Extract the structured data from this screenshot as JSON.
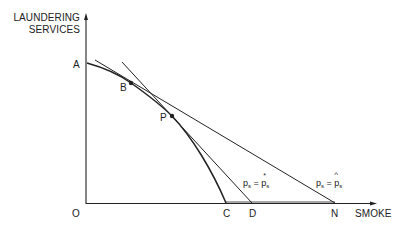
{
  "diagram": {
    "y_axis_label_line1": "LAUNDERING",
    "y_axis_label_line2": "SERVICES",
    "x_axis_label": "SMOKE",
    "origin_label": "O",
    "points": {
      "A": "A",
      "B": "B",
      "P": "P",
      "C": "C",
      "D": "D",
      "N": "N"
    },
    "line_labels": {
      "star_lhs": "p",
      "star_lhs_sub": "s",
      "star_eq": "=",
      "star_rhs": "p",
      "star_rhs_sub": "s",
      "star_mark": "*",
      "hat_lhs": "p",
      "hat_lhs_sub": "s",
      "hat_eq": "=",
      "hat_rhs": "p",
      "hat_rhs_sub": "s",
      "hat_mark": "^"
    },
    "colors": {
      "ink": "#222222",
      "background": "#ffffff"
    }
  }
}
